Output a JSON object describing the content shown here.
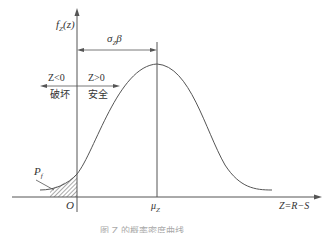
{
  "diagram": {
    "type": "probability-density-curve",
    "y_axis_label": "f_Z(z)",
    "x_axis_label": "Z=R−S",
    "origin_label": "O",
    "mean_label": "μ_Z",
    "distance_label": "σ_Z β",
    "left_region": {
      "condition": "Z<0",
      "meaning": "破坏"
    },
    "right_region": {
      "condition": "Z>0",
      "meaning": "安全"
    },
    "failure_prob_label": "P_f",
    "caption": "图 Z 的概率密度曲线"
  },
  "labels": {
    "fz": "f",
    "fz_sub": "Z",
    "fz_arg": "(z)",
    "sigma": "σ",
    "sigma_sub": "Z",
    "beta": "β",
    "z_lt": "Z<0",
    "z_gt": "Z>0",
    "fail": "破坏",
    "safe": "安全",
    "pf": "P",
    "pf_sub": "f",
    "origin": "O",
    "mu": "μ",
    "mu_sub": "Z",
    "xaxis": "Z=R−S",
    "caption": "图   Z 的概率密度曲线"
  }
}
